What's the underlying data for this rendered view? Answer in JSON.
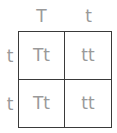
{
  "punnett_square": {
    "column_alleles": [
      "T",
      "t"
    ],
    "row_alleles": [
      "t",
      "t"
    ],
    "cells": [
      [
        "Tt",
        "tt"
      ],
      [
        "Tt",
        "tt"
      ]
    ]
  },
  "colors": {
    "text": "#9a9a9a",
    "border": "#3a3a3a",
    "background": "#ffffff"
  }
}
